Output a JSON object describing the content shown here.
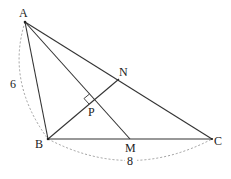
{
  "diagram": {
    "type": "geometry",
    "points": {
      "A": {
        "label": "A",
        "x": 25,
        "y": 22
      },
      "B": {
        "label": "B",
        "x": 48,
        "y": 139
      },
      "C": {
        "label": "C",
        "x": 212,
        "y": 139
      },
      "M": {
        "label": "M",
        "x": 130,
        "y": 139
      },
      "N": {
        "label": "N",
        "x": 119,
        "y": 79
      },
      "P": {
        "label": "P",
        "x": 95,
        "y": 100
      }
    },
    "segments": [
      "AB",
      "BC",
      "CA",
      "AM",
      "BN"
    ],
    "right_angle_at": "P",
    "dimensions": [
      {
        "between": "AB",
        "label": "6"
      },
      {
        "between": "BC",
        "label": "8"
      }
    ],
    "colors": {
      "line": "#333333",
      "dash": "#777777"
    }
  }
}
